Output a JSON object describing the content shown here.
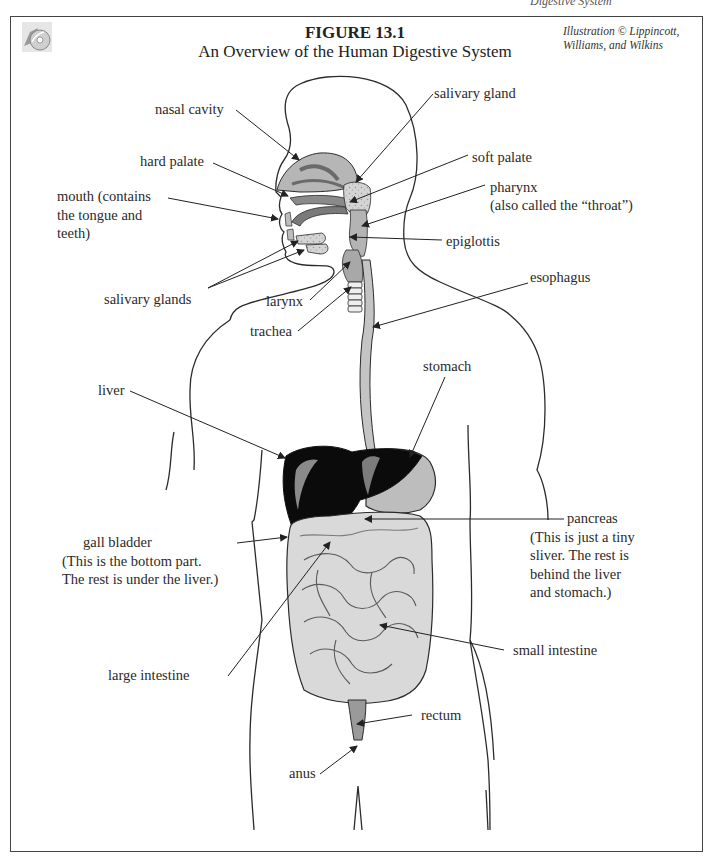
{
  "page_header": "Digestive System",
  "figure": {
    "number": "FIGURE 13.1",
    "title": "An Overview of the Human Digestive System",
    "credit_line1": "Illustration © Lippincott,",
    "credit_line2": "Williams, and Wilkins",
    "icon": "cd-disc-icon"
  },
  "colors": {
    "outline": "#2b2b2b",
    "organ_gray": "#b8b8b8",
    "organ_light": "#d9d9d9",
    "liver": "#0a0a0a",
    "frame": "#444444"
  },
  "labels": {
    "nasal_cavity": "nasal cavity",
    "hard_palate": "hard palate",
    "mouth_l1": "mouth (contains",
    "mouth_l2": "the tongue and",
    "mouth_l3": "teeth)",
    "salivary_glands": "salivary glands",
    "salivary_gland": "salivary gland",
    "soft_palate": "soft palate",
    "pharynx_l1": "pharynx",
    "pharynx_l2": "(also called the “throat”)",
    "epiglottis": "epiglottis",
    "larynx": "larynx",
    "trachea": "trachea",
    "esophagus": "esophagus",
    "stomach": "stomach",
    "liver": "liver",
    "gall_bladder_l1": "gall bladder",
    "gall_bladder_l2": "(This is the bottom part.",
    "gall_bladder_l3": "The rest is under the liver.)",
    "pancreas_l1": "pancreas",
    "pancreas_l2": "(This is just a tiny",
    "pancreas_l3": "sliver.  The rest is",
    "pancreas_l4": "behind the liver",
    "pancreas_l5": "and stomach.)",
    "small_intestine": "small intestine",
    "large_intestine": "large intestine",
    "rectum": "rectum",
    "anus": "anus"
  }
}
